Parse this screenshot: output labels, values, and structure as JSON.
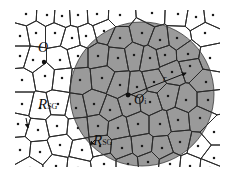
{
  "figure": {
    "type": "voronoi-diagram",
    "width": 233,
    "height": 189,
    "colors": {
      "background": "#ffffff",
      "cell_edge": "#2a2a2a",
      "shaded_region": "#9a9a9a",
      "seed": "#1a1a1a",
      "circle": "#3a3a3a"
    },
    "clip": {
      "x": 15,
      "y": 10,
      "w": 205,
      "h": 157
    },
    "shaded_circle": {
      "cx": 142,
      "cy": 94,
      "r": 72
    },
    "seeds": [
      [
        26,
        14
      ],
      [
        47,
        15
      ],
      [
        62,
        16
      ],
      [
        78,
        15
      ],
      [
        97,
        14
      ],
      [
        120,
        15
      ],
      [
        152,
        13
      ],
      [
        178,
        14
      ],
      [
        196,
        17
      ],
      [
        213,
        15
      ],
      [
        20,
        36
      ],
      [
        36,
        33
      ],
      [
        55,
        33
      ],
      [
        72,
        38
      ],
      [
        86,
        36
      ],
      [
        104,
        31
      ],
      [
        120,
        38
      ],
      [
        142,
        33
      ],
      [
        160,
        40
      ],
      [
        177,
        38
      ],
      [
        205,
        33
      ],
      [
        20,
        56
      ],
      [
        33,
        60
      ],
      [
        60,
        60
      ],
      [
        78,
        56
      ],
      [
        98,
        56
      ],
      [
        118,
        58
      ],
      [
        134,
        55
      ],
      [
        150,
        58
      ],
      [
        165,
        55
      ],
      [
        188,
        54
      ],
      [
        210,
        58
      ],
      [
        22,
        80
      ],
      [
        45,
        76
      ],
      [
        62,
        78
      ],
      [
        80,
        80
      ],
      [
        102,
        78
      ],
      [
        120,
        85
      ],
      [
        137,
        87
      ],
      [
        154,
        82
      ],
      [
        172,
        72
      ],
      [
        190,
        66
      ],
      [
        206,
        82
      ],
      [
        22,
        104
      ],
      [
        40,
        108
      ],
      [
        58,
        104
      ],
      [
        76,
        108
      ],
      [
        94,
        104
      ],
      [
        110,
        110
      ],
      [
        130,
        104
      ],
      [
        150,
        102
      ],
      [
        168,
        96
      ],
      [
        186,
        100
      ],
      [
        208,
        100
      ],
      [
        18,
        124
      ],
      [
        38,
        130
      ],
      [
        57,
        126
      ],
      [
        78,
        128
      ],
      [
        98,
        126
      ],
      [
        118,
        128
      ],
      [
        138,
        124
      ],
      [
        160,
        124
      ],
      [
        178,
        120
      ],
      [
        200,
        118
      ],
      [
        214,
        132
      ],
      [
        20,
        150
      ],
      [
        40,
        152
      ],
      [
        60,
        145
      ],
      [
        82,
        150
      ],
      [
        100,
        146
      ],
      [
        122,
        148
      ],
      [
        142,
        146
      ],
      [
        162,
        148
      ],
      [
        180,
        142
      ],
      [
        198,
        146
      ],
      [
        214,
        158
      ],
      [
        30,
        168
      ],
      [
        56,
        166
      ],
      [
        78,
        168
      ],
      [
        104,
        164
      ],
      [
        128,
        164
      ],
      [
        148,
        162
      ],
      [
        170,
        164
      ],
      [
        190,
        166
      ],
      [
        210,
        168
      ]
    ],
    "circle_center_point": {
      "x": 128,
      "y": 95
    },
    "origin_point": {
      "x": 44,
      "y": 62
    },
    "arrows": [
      {
        "name": "radius-arrow",
        "from": [
          130,
          95
        ],
        "to": [
          186,
          73
        ]
      },
      {
        "name": "rsg-left-arrow",
        "from": [
          26,
          118
        ],
        "to": [
          28,
          128
        ]
      },
      {
        "name": "rsg-bottom-arrow",
        "from": [
          95,
          140
        ],
        "to": [
          90,
          145
        ]
      }
    ],
    "labels": {
      "o_prime": {
        "text": "O",
        "sub": "",
        "x": 38,
        "y": 41
      },
      "o_i": {
        "text": "O",
        "sub": "i",
        "x": 134,
        "y": 93
      },
      "r": {
        "text": "r",
        "x": 163,
        "y": 74
      },
      "rsg_left": {
        "text": "R",
        "sub": "SG",
        "x": 38,
        "y": 97
      },
      "rsg_bottom": {
        "text": "R",
        "sub": "SG",
        "x": 93,
        "y": 133
      }
    }
  }
}
